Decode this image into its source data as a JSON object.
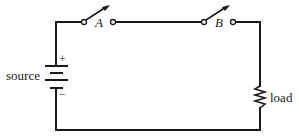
{
  "diagram": {
    "type": "circuit",
    "components": {
      "source": {
        "label": "source",
        "plus": "+",
        "minus": "−"
      },
      "switch_a": {
        "label": "A",
        "state": "open"
      },
      "switch_b": {
        "label": "B",
        "state": "open"
      },
      "load": {
        "label": "load"
      }
    },
    "colors": {
      "wire": "#1a1a1a",
      "background": "#ffffff"
    }
  }
}
